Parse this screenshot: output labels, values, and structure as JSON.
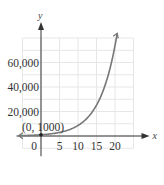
{
  "chart_data": {
    "type": "line",
    "title": "",
    "xlabel": "x",
    "ylabel": "y",
    "xlim": [
      -5,
      25
    ],
    "ylim": [
      -10000,
      80000
    ],
    "grid": true,
    "x_ticks": [
      0,
      5,
      10,
      15,
      20
    ],
    "x_tick_labels": [
      "0",
      "5",
      "10",
      "15",
      "20"
    ],
    "y_ticks": [
      20000,
      40000,
      60000
    ],
    "y_tick_labels": [
      "20,000",
      "40,000",
      "60,000"
    ],
    "annotations": [
      {
        "text": "(0, 1000)",
        "x": 0,
        "y": 1000
      }
    ],
    "series": [
      {
        "name": "exponential growth",
        "color": "#777777",
        "x": [
          -5,
          -2.5,
          0,
          2.5,
          5,
          7.5,
          10,
          12.5,
          15,
          17.5,
          20,
          20.6
        ],
        "values": [
          340,
          580,
          1000,
          1710,
          2930,
          5020,
          8600,
          14700,
          25200,
          43100,
          73900,
          80000
        ]
      }
    ]
  }
}
